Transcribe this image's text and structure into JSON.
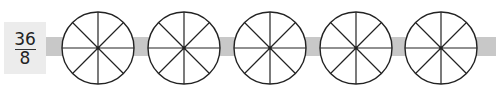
{
  "fraction": {
    "numerator": "36",
    "denominator": "8"
  },
  "circles": {
    "count": 5,
    "parts_per_circle": 8,
    "centers_x": [
      98,
      184,
      270,
      356,
      441
    ],
    "center_y": 48,
    "radius": 36
  },
  "colors": {
    "band": "#c8c8c8",
    "box": "#ececec",
    "stroke": "#222222"
  }
}
